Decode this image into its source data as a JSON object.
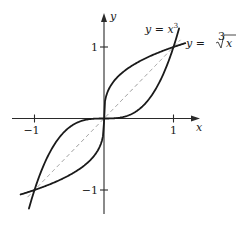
{
  "chart_data": {
    "type": "line",
    "title": "",
    "xlabel": "x",
    "ylabel": "y",
    "xlim": [
      -1.3,
      1.37
    ],
    "ylim": [
      -1.34,
      1.46
    ],
    "grid": false,
    "x_ticks": [
      {
        "value": -1,
        "label": "−1"
      },
      {
        "value": 1,
        "label": "1"
      }
    ],
    "y_ticks": [
      {
        "value": -1,
        "label": "−1"
      },
      {
        "value": 1,
        "label": "1"
      }
    ],
    "series": [
      {
        "name": "y = x³",
        "function": "x^3",
        "x_range": [
          -1.08,
          1.08
        ],
        "style": "solid",
        "color": "#1a1a1a"
      },
      {
        "name": "y = ∛x",
        "function": "cbrt(x)",
        "x_range": [
          -1.2,
          1.17
        ],
        "style": "solid",
        "color": "#1a1a1a"
      },
      {
        "name": "y = x",
        "function": "x",
        "x_range": [
          -1.1,
          1.1
        ],
        "style": "dashed",
        "color": "#9a9a9a"
      }
    ],
    "annotations": [
      {
        "text_prefix": "y = x",
        "text_sup": "3",
        "near": [
          1.0,
          1.25
        ]
      },
      {
        "text_prefix": "y = ",
        "text_root_index": "3",
        "text_radicand": "x",
        "near": [
          1.25,
          1.0
        ]
      }
    ]
  }
}
